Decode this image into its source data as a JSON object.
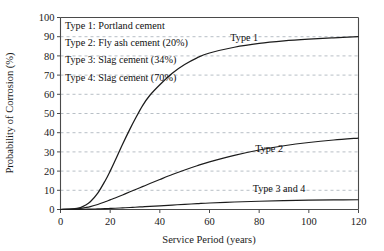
{
  "chart_data": {
    "type": "line",
    "title": "",
    "xlabel": "Service Period (years)",
    "ylabel": "Probability of Corrosion (%)",
    "xlim": [
      0,
      120
    ],
    "ylim": [
      0,
      100
    ],
    "xticks": [
      0,
      20,
      40,
      60,
      80,
      100,
      120
    ],
    "yticks": [
      0,
      10,
      20,
      30,
      40,
      50,
      60,
      70,
      80,
      90,
      100
    ],
    "grid": true,
    "grid_axis": "y",
    "legend_position": "top-left-inside",
    "x": [
      0,
      5,
      8,
      10,
      12,
      15,
      18,
      20,
      22,
      25,
      28,
      30,
      33,
      36,
      40,
      45,
      50,
      55,
      60,
      70,
      80,
      90,
      100,
      110,
      120
    ],
    "series": [
      {
        "name": "Type 1",
        "label": "Type 1",
        "color": "#1c1c1c",
        "values": [
          0,
          0.3,
          1,
          2.2,
          4,
          8.5,
          15,
          20,
          25.5,
          34,
          42,
          47,
          54,
          59.5,
          65,
          71,
          75.5,
          79,
          81.5,
          84.5,
          86.5,
          87.8,
          88.7,
          89.4,
          90
        ],
        "label_position": {
          "x": 72,
          "y": 87
        }
      },
      {
        "name": "Type 2",
        "label": "Type 2",
        "color": "#1c1c1c",
        "values": [
          0,
          0.2,
          0.6,
          1.0,
          1.5,
          2.6,
          4.0,
          5.0,
          6.0,
          7.6,
          9.2,
          10.3,
          11.9,
          13.5,
          15.6,
          18.2,
          20.6,
          22.8,
          24.8,
          28.2,
          31.0,
          33.2,
          34.9,
          36.2,
          37.2
        ]
      },
      {
        "name": "Type 3 and 4",
        "label": "Type 3 and 4",
        "color": "#1c1c1c",
        "values": [
          0,
          0.05,
          0.1,
          0.15,
          0.2,
          0.3,
          0.45,
          0.55,
          0.65,
          0.85,
          1.05,
          1.2,
          1.4,
          1.6,
          1.9,
          2.3,
          2.7,
          3.05,
          3.4,
          3.9,
          4.3,
          4.6,
          4.85,
          5.0,
          5.1
        ]
      }
    ],
    "annotations": [
      {
        "name": "type-1-curve-label",
        "text": "Type 1",
        "x": 74,
        "y": 88
      },
      {
        "name": "type-2-curve-label",
        "text": "Type 2",
        "x": 84,
        "y": 30
      },
      {
        "name": "type-3-4-curve-label",
        "text": "Type 3 and 4",
        "x": 88,
        "y": 9
      }
    ]
  },
  "legend": {
    "items": [
      {
        "label": "Type 1: Portland cement"
      },
      {
        "label": "Type 2: Fly ash cement (20%)"
      },
      {
        "label": "Type 3: Slag cement (34%)"
      },
      {
        "label": "Type 4: Slag cement (70%)"
      }
    ]
  },
  "axes": {
    "x_title": "Service Period (years)",
    "y_title": "Probability of Corrosion (%)",
    "x_tick_labels": [
      "0",
      "20",
      "40",
      "60",
      "80",
      "100",
      "120"
    ],
    "y_tick_labels": [
      "0",
      "10",
      "20",
      "30",
      "40",
      "50",
      "60",
      "70",
      "80",
      "90",
      "100"
    ]
  },
  "colors": {
    "curve": "#1c1c1c",
    "grid": "#9aa3ad",
    "axis": "#4a4a4a",
    "background": "#ffffff"
  }
}
